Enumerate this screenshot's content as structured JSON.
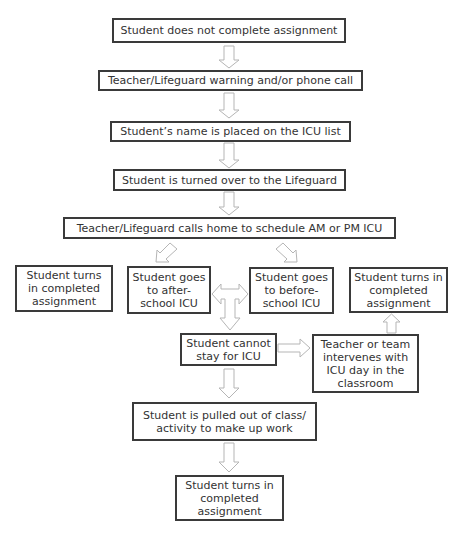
{
  "diagram": {
    "type": "flowchart",
    "nodes": {
      "n1": "Student does not complete assignment",
      "n2": "Teacher/Lifeguard warning and/or phone call",
      "n3": "Student’s name is placed on the ICU list",
      "n4": "Student is turned over to the Lifeguard",
      "n5": "Teacher/Lifeguard calls home to schedule AM or PM ICU",
      "n6": "Student turns in completed assignment",
      "n7": "Student goes to after-school ICU",
      "n8": "Student goes to before-school ICU",
      "n9": "Student turns in completed assignment",
      "n10": "Student cannot stay for ICU",
      "n11": "Teacher or team intervenes with ICU day in the classroom",
      "n12": "Student is pulled out of class/ activity to make up work",
      "n13": "Student turns in completed assignment"
    },
    "edges": [
      [
        "n1",
        "n2"
      ],
      [
        "n2",
        "n3"
      ],
      [
        "n3",
        "n4"
      ],
      [
        "n4",
        "n5"
      ],
      [
        "n5",
        "n7"
      ],
      [
        "n5",
        "n8"
      ],
      [
        "n7",
        "n8"
      ],
      [
        "n8",
        "n7"
      ],
      [
        "n7",
        "n10"
      ],
      [
        "n10",
        "n11"
      ],
      [
        "n11",
        "n9"
      ],
      [
        "n10",
        "n12"
      ],
      [
        "n12",
        "n13"
      ]
    ]
  }
}
